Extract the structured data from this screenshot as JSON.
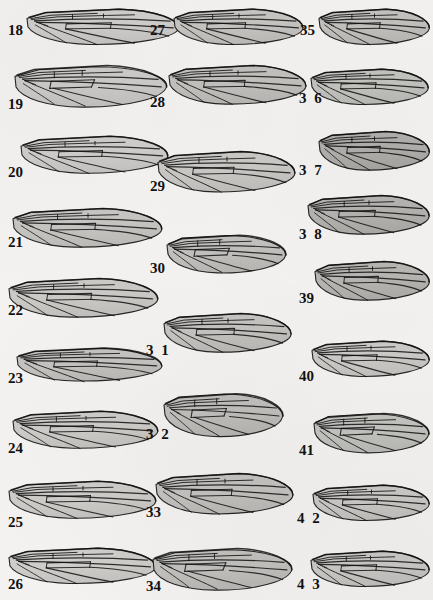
{
  "plate": {
    "title": "Plate of insect wing illustrations",
    "description": "Grayscale halftone drawings of dipteran wings with venation, arranged in three columns and numbered 18 through 43.",
    "background_color": "#f3f2f0",
    "ink_color": "#111111",
    "columns": 3,
    "figure_count": 26,
    "number_range": "18-43"
  },
  "figures": [
    {
      "id": "fig-18",
      "label": "18",
      "label_spaced": false,
      "column": 1,
      "x": 26,
      "y": 6,
      "w": 155,
      "h": 42,
      "label_x": 8,
      "label_y": 36,
      "tone": "light",
      "style": "long-slender",
      "fill": "#d9d8d6"
    },
    {
      "id": "fig-19",
      "label": "19",
      "label_spaced": false,
      "column": 1,
      "x": 14,
      "y": 62,
      "w": 155,
      "h": 48,
      "label_x": 8,
      "label_y": 110,
      "tone": "light",
      "style": "broad-rounded",
      "fill": "#d6d5d3"
    },
    {
      "id": "fig-20",
      "label": "20",
      "label_spaced": false,
      "column": 1,
      "x": 20,
      "y": 133,
      "w": 150,
      "h": 44,
      "label_x": 8,
      "label_y": 178,
      "tone": "light",
      "style": "long-slender",
      "fill": "#d8d7d5"
    },
    {
      "id": "fig-21",
      "label": "21",
      "label_spaced": false,
      "column": 1,
      "x": 12,
      "y": 205,
      "w": 152,
      "h": 46,
      "label_x": 8,
      "label_y": 248,
      "tone": "mid",
      "style": "long-slender",
      "fill": "#cfcecb"
    },
    {
      "id": "fig-22",
      "label": "22",
      "label_spaced": false,
      "column": 1,
      "x": 8,
      "y": 275,
      "w": 152,
      "h": 46,
      "label_x": 8,
      "label_y": 316,
      "tone": "light",
      "style": "long-slender",
      "fill": "#d4d3d0"
    },
    {
      "id": "fig-23",
      "label": "23",
      "label_spaced": false,
      "column": 1,
      "x": 16,
      "y": 345,
      "w": 148,
      "h": 40,
      "label_x": 8,
      "label_y": 384,
      "tone": "mid",
      "style": "narrow",
      "fill": "#cdccc9"
    },
    {
      "id": "fig-24",
      "label": "24",
      "label_spaced": false,
      "column": 1,
      "x": 12,
      "y": 408,
      "w": 148,
      "h": 44,
      "label_x": 8,
      "label_y": 454,
      "tone": "light",
      "style": "long-slender",
      "fill": "#d6d5d2"
    },
    {
      "id": "fig-25",
      "label": "25",
      "label_spaced": false,
      "column": 1,
      "x": 8,
      "y": 478,
      "w": 150,
      "h": 44,
      "label_x": 8,
      "label_y": 528,
      "tone": "light",
      "style": "long-slender",
      "fill": "#d7d6d3"
    },
    {
      "id": "fig-26",
      "label": "26",
      "label_spaced": false,
      "column": 1,
      "x": 8,
      "y": 545,
      "w": 150,
      "h": 42,
      "label_x": 8,
      "label_y": 590,
      "tone": "light",
      "style": "long-slender",
      "fill": "#d8d7d4"
    },
    {
      "id": "fig-27",
      "label": "27",
      "label_spaced": false,
      "column": 2,
      "x": 173,
      "y": 6,
      "w": 132,
      "h": 42,
      "label_x": 150,
      "label_y": 36,
      "tone": "mid",
      "style": "long-slender",
      "fill": "#cfcecb"
    },
    {
      "id": "fig-28",
      "label": "28",
      "label_spaced": false,
      "column": 2,
      "x": 168,
      "y": 62,
      "w": 140,
      "h": 46,
      "label_x": 150,
      "label_y": 108,
      "tone": "mid",
      "style": "long-slender",
      "fill": "#cbcac7"
    },
    {
      "id": "fig-29",
      "label": "29",
      "label_spaced": false,
      "column": 2,
      "x": 157,
      "y": 148,
      "w": 140,
      "h": 48,
      "label_x": 150,
      "label_y": 192,
      "tone": "light",
      "style": "long-slender",
      "fill": "#d3d2cf"
    },
    {
      "id": "fig-30",
      "label": "30",
      "label_spaced": false,
      "column": 2,
      "x": 166,
      "y": 232,
      "w": 122,
      "h": 44,
      "label_x": 150,
      "label_y": 274,
      "tone": "mid",
      "style": "short-broad",
      "fill": "#cac9c6"
    },
    {
      "id": "fig-31",
      "label": "3 1",
      "label_spaced": true,
      "column": 2,
      "x": 163,
      "y": 310,
      "w": 130,
      "h": 46,
      "label_x": 146,
      "label_y": 356,
      "tone": "mid",
      "style": "long-slender",
      "fill": "#cdccc9"
    },
    {
      "id": "fig-32",
      "label": "3 2",
      "label_spaced": true,
      "column": 2,
      "x": 163,
      "y": 390,
      "w": 122,
      "h": 50,
      "label_x": 146,
      "label_y": 440,
      "tone": "mid",
      "style": "short-broad",
      "fill": "#c9c8c5"
    },
    {
      "id": "fig-33",
      "label": "33",
      "label_spaced": false,
      "column": 2,
      "x": 155,
      "y": 470,
      "w": 140,
      "h": 48,
      "label_x": 146,
      "label_y": 518,
      "tone": "mid",
      "style": "long-slender",
      "fill": "#cdccc9"
    },
    {
      "id": "fig-34",
      "label": "34",
      "label_spaced": false,
      "column": 2,
      "x": 152,
      "y": 545,
      "w": 142,
      "h": 48,
      "label_x": 146,
      "label_y": 592,
      "tone": "mid",
      "style": "broad-rounded",
      "fill": "#cbcac7"
    },
    {
      "id": "fig-35",
      "label": "35",
      "label_spaced": false,
      "column": 3,
      "x": 318,
      "y": 6,
      "w": 113,
      "h": 42,
      "label_x": 300,
      "label_y": 36,
      "tone": "mid",
      "style": "long-slender",
      "fill": "#cbcac7"
    },
    {
      "id": "fig-36",
      "label": "3 6",
      "label_spaced": true,
      "column": 3,
      "x": 310,
      "y": 66,
      "w": 120,
      "h": 42,
      "label_x": 299,
      "label_y": 104,
      "tone": "mid",
      "style": "long-slender",
      "fill": "#ccccc8"
    },
    {
      "id": "fig-37",
      "label": "3 7",
      "label_spaced": true,
      "column": 3,
      "x": 318,
      "y": 128,
      "w": 113,
      "h": 46,
      "label_x": 299,
      "label_y": 176,
      "tone": "dark",
      "style": "long-slender",
      "fill": "#b8b7b4"
    },
    {
      "id": "fig-38",
      "label": "3 8",
      "label_spaced": true,
      "column": 3,
      "x": 307,
      "y": 192,
      "w": 124,
      "h": 46,
      "label_x": 299,
      "label_y": 240,
      "tone": "dark",
      "style": "long-slender",
      "fill": "#bcbbb8"
    },
    {
      "id": "fig-39",
      "label": "39",
      "label_spaced": false,
      "column": 3,
      "x": 314,
      "y": 258,
      "w": 117,
      "h": 46,
      "label_x": 299,
      "label_y": 304,
      "tone": "dark",
      "style": "long-slender",
      "fill": "#bfbeba"
    },
    {
      "id": "fig-40",
      "label": "40",
      "label_spaced": false,
      "column": 3,
      "x": 311,
      "y": 338,
      "w": 120,
      "h": 42,
      "label_x": 299,
      "label_y": 382,
      "tone": "light",
      "style": "long-slender",
      "fill": "#d5d4d1"
    },
    {
      "id": "fig-41",
      "label": "41",
      "label_spaced": false,
      "column": 3,
      "x": 313,
      "y": 410,
      "w": 118,
      "h": 46,
      "label_x": 299,
      "label_y": 456,
      "tone": "mid",
      "style": "short-broad",
      "fill": "#ccccc8"
    },
    {
      "id": "fig-42",
      "label": "4 2",
      "label_spaced": true,
      "column": 3,
      "x": 312,
      "y": 482,
      "w": 119,
      "h": 42,
      "label_x": 297,
      "label_y": 524,
      "tone": "light",
      "style": "long-slender",
      "fill": "#d4d3d0"
    },
    {
      "id": "fig-43",
      "label": "4 3",
      "label_spaced": true,
      "column": 3,
      "x": 310,
      "y": 548,
      "w": 121,
      "h": 42,
      "label_x": 297,
      "label_y": 590,
      "tone": "light",
      "style": "long-slender",
      "fill": "#d4d3d0"
    }
  ]
}
